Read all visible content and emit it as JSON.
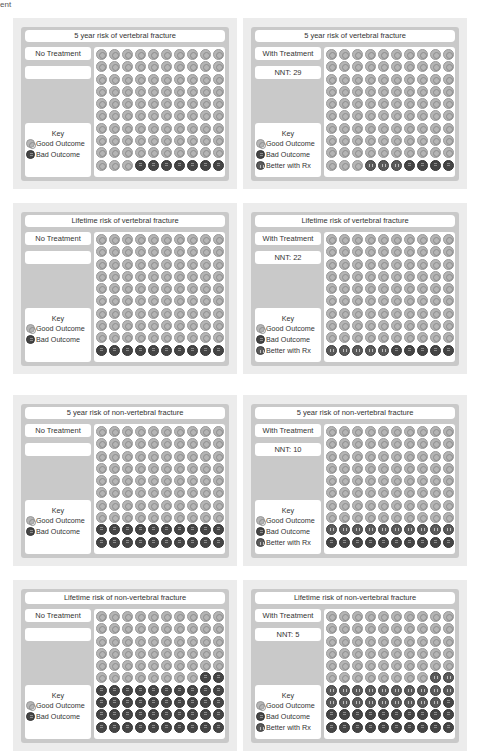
{
  "header_fragment": "ent",
  "key": {
    "title": "Key",
    "good": "Good Outcome",
    "bad": "Bad Outcome",
    "better": "Better with Rx"
  },
  "colors": {
    "good": "#b5b5b5",
    "bad": "#454545",
    "better": "#5a5a5a",
    "panel_bg": "#c9c9c9"
  },
  "panels": [
    {
      "title": "5 year risk of vertebral fracture",
      "label": "No Treatment",
      "nnt": "",
      "good": 93,
      "better": 0,
      "bad": 7
    },
    {
      "title": "5  year risk of vertebral fracture",
      "label": "With  Treatment",
      "nnt": "NNT: 29",
      "good": 93,
      "better": 3,
      "bad": 4
    },
    {
      "title": "Lifetime risk of vertebral fracture",
      "label": "No Treatment",
      "nnt": "",
      "good": 90,
      "better": 0,
      "bad": 10
    },
    {
      "title": "Lifetime risk of vertebral fracture",
      "label": "With Treatment",
      "nnt": "NNT: 22",
      "good": 90,
      "better": 5,
      "bad": 5
    },
    {
      "title": "5  year risk of non-vertebral fracture",
      "label": "No  Treatment",
      "nnt": "",
      "good": 80,
      "better": 0,
      "bad": 20
    },
    {
      "title": "5 year risk of non-vertebral fracture",
      "label": "With Treatment",
      "nnt": "NNT: 10",
      "good": 80,
      "better": 10,
      "bad": 10
    },
    {
      "title": "Lifetime risk of non-vertebral fracture",
      "label": "No Treatment",
      "nnt": "",
      "good": 58,
      "better": 0,
      "bad": 42
    },
    {
      "title": "Lifetime risk of non-vertebral fracture",
      "label": "With  Treatment",
      "nnt": "NNT: 5",
      "good": 58,
      "better": 21,
      "bad": 21
    }
  ],
  "chart_data": [
    {
      "type": "pictograph",
      "title": "5 year risk of vertebral fracture",
      "subtitle": "No Treatment",
      "categories": [
        "Good Outcome",
        "Bad Outcome"
      ],
      "values": [
        93,
        7
      ],
      "total": 100
    },
    {
      "type": "pictograph",
      "title": "5 year risk of vertebral fracture",
      "subtitle": "With Treatment",
      "annotation": "NNT: 29",
      "categories": [
        "Good Outcome",
        "Better with Rx",
        "Bad Outcome"
      ],
      "values": [
        93,
        3,
        4
      ],
      "total": 100
    },
    {
      "type": "pictograph",
      "title": "Lifetime risk of vertebral fracture",
      "subtitle": "No Treatment",
      "categories": [
        "Good Outcome",
        "Bad Outcome"
      ],
      "values": [
        90,
        10
      ],
      "total": 100
    },
    {
      "type": "pictograph",
      "title": "Lifetime risk of vertebral fracture",
      "subtitle": "With Treatment",
      "annotation": "NNT: 22",
      "categories": [
        "Good Outcome",
        "Better with Rx",
        "Bad Outcome"
      ],
      "values": [
        90,
        5,
        5
      ],
      "total": 100
    },
    {
      "type": "pictograph",
      "title": "5 year risk of non-vertebral fracture",
      "subtitle": "No Treatment",
      "categories": [
        "Good Outcome",
        "Bad Outcome"
      ],
      "values": [
        80,
        20
      ],
      "total": 100
    },
    {
      "type": "pictograph",
      "title": "5 year risk of non-vertebral fracture",
      "subtitle": "With Treatment",
      "annotation": "NNT: 10",
      "categories": [
        "Good Outcome",
        "Better with Rx",
        "Bad Outcome"
      ],
      "values": [
        80,
        10,
        10
      ],
      "total": 100
    },
    {
      "type": "pictograph",
      "title": "Lifetime risk of non-vertebral fracture",
      "subtitle": "No Treatment",
      "categories": [
        "Good Outcome",
        "Bad Outcome"
      ],
      "values": [
        58,
        42
      ],
      "total": 100
    },
    {
      "type": "pictograph",
      "title": "Lifetime risk of non-vertebral fracture",
      "subtitle": "With Treatment",
      "annotation": "NNT: 5",
      "categories": [
        "Good Outcome",
        "Better with Rx",
        "Bad Outcome"
      ],
      "values": [
        58,
        21,
        21
      ],
      "total": 100
    }
  ]
}
